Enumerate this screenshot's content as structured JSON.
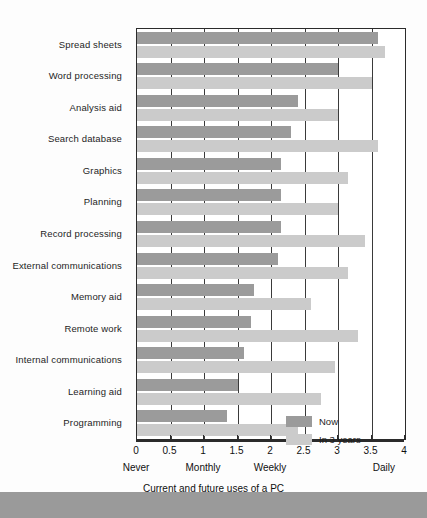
{
  "chart_data": {
    "type": "bar",
    "orientation": "horizontal",
    "title": "",
    "xlabel": "Current and future uses of a PC",
    "ylabel": "",
    "xlim": [
      0,
      4
    ],
    "grid": true,
    "legend_position": "bottom-right",
    "categories": [
      "Spread sheets",
      "Word processing",
      "Analysis aid",
      "Search database",
      "Graphics",
      "Planning",
      "Record processing",
      "External communications",
      "Memory aid",
      "Remote work",
      "Internal communications",
      "Learning aid",
      "Programming"
    ],
    "series": [
      {
        "name": "Now",
        "color": "#9b9b9b",
        "values": [
          3.6,
          3.0,
          2.4,
          2.3,
          2.15,
          2.15,
          2.15,
          2.1,
          1.75,
          1.7,
          1.6,
          1.5,
          1.35
        ]
      },
      {
        "name": "In 3 years",
        "color": "#cbcbcb",
        "values": [
          3.7,
          3.5,
          3.0,
          3.6,
          3.15,
          3.0,
          3.4,
          3.15,
          2.6,
          3.3,
          2.95,
          2.75,
          2.4
        ]
      }
    ],
    "xticks": [
      0,
      0.5,
      1,
      1.5,
      2,
      2.5,
      3,
      3.5,
      4
    ],
    "xtick_labels": [
      "0",
      "0.5",
      "1",
      "1.5",
      "2",
      "2.5",
      "3",
      "3.5",
      "4"
    ],
    "x_sub_labels": [
      {
        "value": 0,
        "label": "Never"
      },
      {
        "value": 1,
        "label": "Monthly"
      },
      {
        "value": 2,
        "label": "Weekly"
      },
      {
        "value": 3.7,
        "label": "Daily"
      }
    ]
  }
}
